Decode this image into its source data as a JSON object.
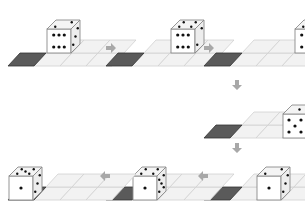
{
  "colors": {
    "grid_fill": "#f2f2f2",
    "grid_line": "#d0d0d0",
    "target_fill": "#5a5a5a",
    "target_stroke": "#333333",
    "die_face": "#ffffff",
    "die_top": "#f4f4f4",
    "die_side": "#ededed",
    "die_stroke": "#8a8a8a",
    "pip": "#111111",
    "arrow": "#a8a8a8"
  },
  "panels": [
    {
      "id": 1,
      "x": 0,
      "y": 0,
      "die_col": 0,
      "die_row": 1,
      "front": 6,
      "top": 2,
      "side": 3
    },
    {
      "id": 2,
      "x": 98,
      "y": 0,
      "die_col": 1,
      "die_row": 1,
      "front": 6,
      "top": 4,
      "side": 2
    },
    {
      "id": 3,
      "x": 196,
      "y": 0,
      "die_col": 2,
      "die_row": 1,
      "front": 6,
      "top": 5,
      "side": 3
    },
    {
      "id": 4,
      "x": 196,
      "y": 72,
      "die_col": 2,
      "die_row": 0,
      "front": 5,
      "top": 1,
      "side": 3
    },
    {
      "id": 5,
      "x": 196,
      "y": 134,
      "die_col": 1,
      "die_row": 0,
      "front": 1,
      "top": 2,
      "side": 3
    },
    {
      "id": 6,
      "x": 98,
      "y": 134,
      "die_col": 0,
      "die_row": 0,
      "front": 1,
      "top": 4,
      "side": 5
    },
    {
      "id": 7,
      "x": 0,
      "y": 134,
      "die_col": -1,
      "die_row": 0,
      "front": 1,
      "top": 5,
      "side": 3
    }
  ],
  "arrows": [
    {
      "dir": "right",
      "x": 106,
      "y": 48
    },
    {
      "dir": "right",
      "x": 204,
      "y": 48
    },
    {
      "dir": "down",
      "x": 237,
      "y": 80
    },
    {
      "dir": "down",
      "x": 237,
      "y": 143
    },
    {
      "dir": "left",
      "x": 198,
      "y": 176
    },
    {
      "dir": "left",
      "x": 100,
      "y": 176
    }
  ]
}
